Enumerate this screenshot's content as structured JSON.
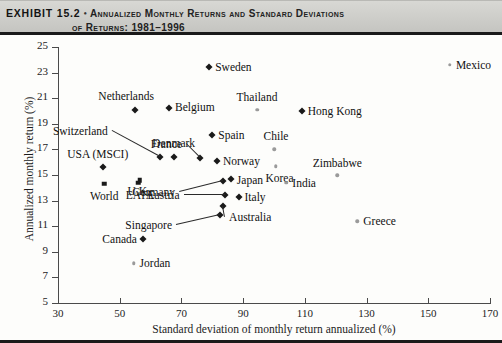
{
  "header": {
    "exhibit_label": "EXHIBIT 15.2",
    "bullet": "•",
    "title_line1": "Annualized Monthly Returns and Standard Deviations",
    "title_line2": "of Returns: 1981–1996"
  },
  "chart_data": {
    "type": "scatter",
    "xlabel": "Standard deviation of monthly return annualized (%)",
    "ylabel": "Annualized monthly return (%)",
    "xlim": [
      30,
      170
    ],
    "ylim": [
      5,
      25
    ],
    "xticks": [
      30,
      50,
      70,
      90,
      110,
      130,
      150,
      170
    ],
    "yticks": [
      5,
      7,
      9,
      11,
      13,
      15,
      17,
      19,
      21,
      23,
      25
    ],
    "grid": false,
    "legend": "none",
    "points": [
      {
        "name": "Sweden",
        "x": 79.0,
        "y": 23.4,
        "marker": "diamond",
        "label_pos": "right",
        "label_dx": 6,
        "label_dy": 0
      },
      {
        "name": "Netherlands",
        "x": 55.0,
        "y": 20.1,
        "marker": "diamond",
        "label_pos": "center",
        "label_dx": -9,
        "label_dy": -14
      },
      {
        "name": "Belgium",
        "x": 66.0,
        "y": 20.2,
        "marker": "diamond",
        "label_pos": "right",
        "label_dx": 6,
        "label_dy": -1
      },
      {
        "name": "Thailand",
        "x": 94.5,
        "y": 20.1,
        "marker": "light",
        "label_pos": "center",
        "label_dx": 0,
        "label_dy": -13
      },
      {
        "name": "Hong Kong",
        "x": 109.0,
        "y": 20.0,
        "marker": "diamond",
        "label_pos": "right",
        "label_dx": 6,
        "label_dy": 0
      },
      {
        "name": "Spain",
        "x": 80.0,
        "y": 18.1,
        "marker": "diamond",
        "label_pos": "right",
        "label_dx": 6,
        "label_dy": 0
      },
      {
        "name": "Chile",
        "x": 100.0,
        "y": 17.0,
        "marker": "light",
        "label_pos": "center",
        "label_dx": 2,
        "label_dy": -13
      },
      {
        "name": "Switzerland",
        "x": 63.0,
        "y": 16.4,
        "marker": "diamond",
        "label_pos": "leader",
        "label_dx": -52,
        "label_dy": -26
      },
      {
        "name": "Denmark",
        "x": 67.5,
        "y": 16.4,
        "marker": "diamond",
        "label_pos": "center",
        "label_dx": 0,
        "label_dy": -14
      },
      {
        "name": "France",
        "x": 76.0,
        "y": 16.3,
        "marker": "diamond",
        "label_pos": "leader",
        "label_dx": -18,
        "label_dy": -14
      },
      {
        "name": "USA (MSCI)",
        "x": 44.5,
        "y": 15.6,
        "marker": "diamond",
        "label_pos": "center",
        "label_dx": -5,
        "label_dy": -13
      },
      {
        "name": "Norway",
        "x": 81.5,
        "y": 16.1,
        "marker": "diamond",
        "label_pos": "right",
        "label_dx": 6,
        "label_dy": 0
      },
      {
        "name": "Korea",
        "x": 100.5,
        "y": 15.7,
        "marker": "light",
        "label_pos": "center",
        "label_dx": 4,
        "label_dy": 12
      },
      {
        "name": "Zimbabwe",
        "x": 120.5,
        "y": 15.0,
        "marker": "light",
        "label_pos": "center",
        "label_dx": 0,
        "label_dy": -12
      },
      {
        "name": "U.K.",
        "x": 56.5,
        "y": 14.6,
        "marker": "square",
        "label_pos": "center",
        "label_dx": -1,
        "label_dy": 11
      },
      {
        "name": "World",
        "x": 45.0,
        "y": 14.3,
        "marker": "square",
        "label_pos": "center",
        "label_dx": 0,
        "label_dy": 12
      },
      {
        "name": "EAFE",
        "x": 56.0,
        "y": 14.4,
        "marker": "square",
        "label_pos": "center",
        "label_dx": 2,
        "label_dy": 12
      },
      {
        "name": "Japan",
        "x": 86.0,
        "y": 14.7,
        "marker": "diamond",
        "label_pos": "right",
        "label_dx": 6,
        "label_dy": 1
      },
      {
        "name": "Germany",
        "x": 83.5,
        "y": 14.5,
        "marker": "diamond",
        "label_pos": "leader",
        "label_dx": -48,
        "label_dy": 11
      },
      {
        "name": "India",
        "x": 104.0,
        "y": 14.4,
        "marker": "light",
        "label_pos": "right",
        "label_dx": 6,
        "label_dy": 0
      },
      {
        "name": "Italy",
        "x": 88.5,
        "y": 13.3,
        "marker": "diamond",
        "label_pos": "right",
        "label_dx": 6,
        "label_dy": 0
      },
      {
        "name": "Austria",
        "x": 84.0,
        "y": 13.4,
        "marker": "diamond",
        "label_pos": "leader",
        "label_dx": -45,
        "label_dy": 0
      },
      {
        "name": "Australia",
        "x": 83.5,
        "y": 12.6,
        "marker": "diamond",
        "label_pos": "leader",
        "label_dx": 6,
        "label_dy": 11
      },
      {
        "name": "Singapore",
        "x": 82.5,
        "y": 11.9,
        "marker": "diamond",
        "label_pos": "leader",
        "label_dx": -48,
        "label_dy": 10
      },
      {
        "name": "Greece",
        "x": 127.0,
        "y": 11.4,
        "marker": "light",
        "label_pos": "right",
        "label_dx": 6,
        "label_dy": 0
      },
      {
        "name": "Canada",
        "x": 57.5,
        "y": 10.0,
        "marker": "diamond",
        "label_pos": "left",
        "label_dx": -6,
        "label_dy": 0
      },
      {
        "name": "Jordan",
        "x": 54.5,
        "y": 8.1,
        "marker": "light",
        "label_pos": "right",
        "label_dx": 6,
        "label_dy": 0
      },
      {
        "name": "Mexico",
        "x": 157.0,
        "y": 23.6,
        "marker": "light",
        "label_pos": "right",
        "label_dx": 6,
        "label_dy": 0
      }
    ]
  }
}
